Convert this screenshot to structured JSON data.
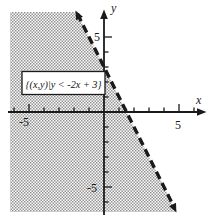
{
  "figure": {
    "axis": {
      "x_label": "x",
      "y_label": "y"
    },
    "tick_labels": {
      "x_pos": "5",
      "x_neg": "-5",
      "y_pos": "5",
      "y_neg": "-5"
    },
    "set_label": "{(x,y)|y < -2x + 3}",
    "colors": {
      "ink": "#1a1a1a",
      "halftone_dot": "#8f8f8f",
      "background": "#ffffff"
    }
  },
  "chart_data": {
    "type": "line",
    "xlabel": "x",
    "ylabel": "y",
    "axis": {
      "xlim": [
        -6.5,
        7
      ],
      "ylim": [
        -7,
        7
      ],
      "tick_interval": 1,
      "labeled_ticks_x": [
        -5,
        5
      ],
      "labeled_ticks_y": [
        -5,
        5
      ],
      "grid": false
    },
    "series": [
      {
        "name": "boundary line y = -2x + 3",
        "style": "dashed, arrows on both ends (line not included, strict inequality)",
        "x": [
          -1.9,
          -1,
          0,
          1.5,
          3,
          4.8
        ],
        "y": [
          6.8,
          5,
          3,
          0,
          -3,
          -6.6
        ]
      }
    ],
    "boundary": {
      "slope": -2,
      "y_intercept": 3,
      "x_intercept": 1.5
    },
    "inequality": "y < -2x + 3",
    "shaded_region": "half-plane left/below the dashed boundary line (contains the origin), filled with gray halftone pattern",
    "annotations": [
      {
        "text": "{(x,y)|y < -2x + 3}",
        "position": "boxed label left of y-axis, above x-axis (around x=-5..0, y=1..2)"
      }
    ],
    "legend": "none"
  }
}
